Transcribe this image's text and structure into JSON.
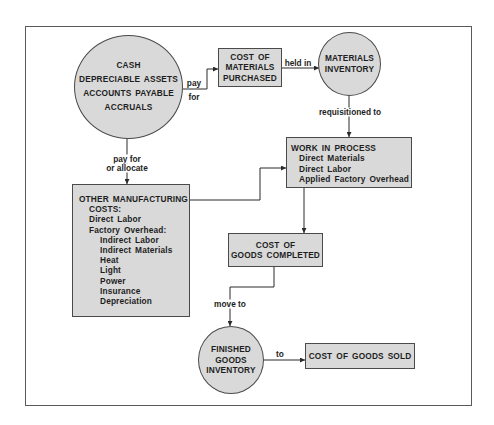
{
  "colors": {
    "node_fill": "#d9d9d9",
    "node_border": "#4a4a4a",
    "frame": "#5a5a5a",
    "text": "#1e1e1e",
    "background": "#ffffff"
  },
  "nodes": {
    "sources": {
      "shape": "circle",
      "lines": [
        "CASH",
        "DEPRECIABLE ASSETS",
        "ACCOUNTS PAYABLE",
        "ACCRUALS"
      ]
    },
    "cost_of_materials_purchased": {
      "shape": "box",
      "lines": [
        "COST OF",
        "MATERIALS",
        "PURCHASED"
      ]
    },
    "materials_inventory": {
      "shape": "circle",
      "lines": [
        "MATERIALS",
        "INVENTORY"
      ]
    },
    "work_in_process": {
      "shape": "box",
      "title": "WORK IN PROCESS",
      "items": [
        "Direct Materials",
        "Direct Labor",
        "Applied Factory Overhead"
      ]
    },
    "other_manufacturing_costs": {
      "shape": "box",
      "title_lines": [
        "OTHER MANUFACTURING",
        "COSTS:"
      ],
      "direct_labor": "Direct Labor",
      "overhead_label": "Factory Overhead:",
      "overhead_items": [
        "Indirect Labor",
        "Indirect Materials",
        "Heat",
        "Light",
        "Power",
        "Insurance",
        "Depreciation"
      ]
    },
    "cost_of_goods_completed": {
      "shape": "box",
      "lines": [
        "COST OF",
        "GOODS COMPLETED"
      ]
    },
    "finished_goods_inventory": {
      "shape": "circle",
      "lines": [
        "FINISHED",
        "GOODS",
        "INVENTORY"
      ]
    },
    "cost_of_goods_sold": {
      "shape": "box",
      "lines": [
        "COST OF GOODS SOLD"
      ]
    }
  },
  "edges": [
    {
      "from": "sources",
      "to": "cost_of_materials_purchased",
      "label_lines": [
        "pay",
        "for"
      ]
    },
    {
      "from": "cost_of_materials_purchased",
      "to": "materials_inventory",
      "label_lines": [
        "held in"
      ]
    },
    {
      "from": "materials_inventory",
      "to": "work_in_process",
      "label_lines": [
        "requisitioned to"
      ]
    },
    {
      "from": "sources",
      "to": "other_manufacturing_costs",
      "label_lines": [
        "pay for",
        "or allocate"
      ]
    },
    {
      "from": "other_manufacturing_costs",
      "to": "work_in_process",
      "label_lines": []
    },
    {
      "from": "work_in_process",
      "to": "cost_of_goods_completed",
      "label_lines": []
    },
    {
      "from": "cost_of_goods_completed",
      "to": "finished_goods_inventory",
      "label_lines": [
        "move to"
      ]
    },
    {
      "from": "finished_goods_inventory",
      "to": "cost_of_goods_sold",
      "label_lines": [
        "to"
      ]
    }
  ]
}
